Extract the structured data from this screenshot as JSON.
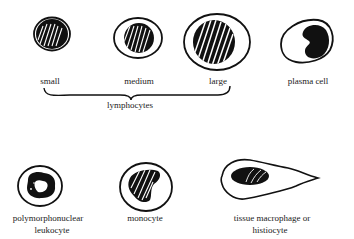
{
  "figure": {
    "colors": {
      "ink": "#111111",
      "background": "#ffffff",
      "label": "#222222"
    },
    "top_row": [
      {
        "id": "small",
        "label": "small"
      },
      {
        "id": "medium",
        "label": "medium"
      },
      {
        "id": "large",
        "label": "large"
      },
      {
        "id": "plasma",
        "label": "plasma cell"
      }
    ],
    "group_label": "lymphocytes",
    "bottom_row": [
      {
        "id": "pmn",
        "label_line1": "polymorphonuclear",
        "label_line2": "leukocyte"
      },
      {
        "id": "monocyte",
        "label_line1": "monocyte"
      },
      {
        "id": "macrophage",
        "label_line1": "tissue macrophage or",
        "label_line2": "histiocyte"
      }
    ]
  }
}
